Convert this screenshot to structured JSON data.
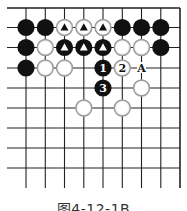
{
  "figure": {
    "caption": "图4-12-1B"
  },
  "board": {
    "cols": 9,
    "rows": 9,
    "x_positions": [
      26,
      45.3,
      64.5,
      83.8,
      103,
      122.3,
      141.5,
      160.8,
      180
    ],
    "y_positions": [
      8,
      27.5,
      47.5,
      68,
      88,
      108,
      128,
      148,
      168
    ],
    "left_extend_to": 7,
    "bottom_extend_to": 188,
    "top_edge": true,
    "right_edge": true,
    "stone_radius": 8.6,
    "colors": {
      "line": "#222222",
      "black_stone": "#111111",
      "white_fill": "#ffffff",
      "white_border": "#9a9a9a",
      "label_on_black": "#ffffff",
      "label_on_white": "#111111"
    },
    "stones": [
      {
        "col": 0,
        "row": 1,
        "color": "black",
        "mark": ""
      },
      {
        "col": 1,
        "row": 1,
        "color": "black",
        "mark": ""
      },
      {
        "col": 2,
        "row": 1,
        "color": "white",
        "mark": "triangle"
      },
      {
        "col": 3,
        "row": 1,
        "color": "white",
        "mark": "triangle"
      },
      {
        "col": 4,
        "row": 1,
        "color": "white",
        "mark": "triangle"
      },
      {
        "col": 5,
        "row": 1,
        "color": "black",
        "mark": ""
      },
      {
        "col": 6,
        "row": 1,
        "color": "black",
        "mark": ""
      },
      {
        "col": 7,
        "row": 1,
        "color": "black",
        "mark": ""
      },
      {
        "col": 0,
        "row": 2,
        "color": "black",
        "mark": ""
      },
      {
        "col": 1,
        "row": 2,
        "color": "white",
        "mark": ""
      },
      {
        "col": 2,
        "row": 2,
        "color": "black",
        "mark": "triangle"
      },
      {
        "col": 3,
        "row": 2,
        "color": "black",
        "mark": "triangle"
      },
      {
        "col": 4,
        "row": 2,
        "color": "black",
        "mark": "triangle"
      },
      {
        "col": 5,
        "row": 2,
        "color": "white",
        "mark": ""
      },
      {
        "col": 6,
        "row": 2,
        "color": "white",
        "mark": ""
      },
      {
        "col": 7,
        "row": 2,
        "color": "black",
        "mark": ""
      },
      {
        "col": 0,
        "row": 3,
        "color": "black",
        "mark": ""
      },
      {
        "col": 1,
        "row": 3,
        "color": "white",
        "mark": ""
      },
      {
        "col": 2,
        "row": 3,
        "color": "white",
        "mark": ""
      },
      {
        "col": 4,
        "row": 3,
        "color": "black",
        "mark": "1"
      },
      {
        "col": 5,
        "row": 3,
        "color": "white",
        "mark": "2"
      },
      {
        "col": 4,
        "row": 4,
        "color": "black",
        "mark": "3"
      },
      {
        "col": 6,
        "row": 4,
        "color": "white",
        "mark": ""
      },
      {
        "col": 3,
        "row": 5,
        "color": "white",
        "mark": ""
      },
      {
        "col": 5,
        "row": 5,
        "color": "white",
        "mark": ""
      }
    ],
    "point_labels": [
      {
        "col": 6,
        "row": 3,
        "text": "A"
      }
    ]
  }
}
